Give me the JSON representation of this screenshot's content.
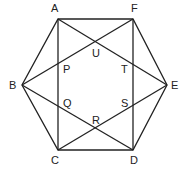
{
  "diagram": {
    "type": "geometry",
    "stroke_color": "#222222",
    "vertices": [
      {
        "id": "A",
        "label": "A",
        "x": 58,
        "y": 19
      },
      {
        "id": "F",
        "label": "F",
        "x": 133,
        "y": 19
      },
      {
        "id": "E",
        "label": "E",
        "x": 167,
        "y": 85
      },
      {
        "id": "D",
        "label": "D",
        "x": 133,
        "y": 150
      },
      {
        "id": "C",
        "label": "C",
        "x": 58,
        "y": 150
      },
      {
        "id": "B",
        "label": "B",
        "x": 22,
        "y": 85
      }
    ],
    "intersections": [
      {
        "id": "P",
        "label": "P"
      },
      {
        "id": "Q",
        "label": "Q"
      },
      {
        "id": "R",
        "label": "R"
      },
      {
        "id": "S",
        "label": "S"
      },
      {
        "id": "T",
        "label": "T"
      },
      {
        "id": "U",
        "label": "U"
      }
    ],
    "segments": [
      "AF",
      "FE",
      "ED",
      "DC",
      "CB",
      "BA",
      "AC",
      "FD",
      "AE",
      "FB",
      "BD",
      "CE"
    ]
  }
}
